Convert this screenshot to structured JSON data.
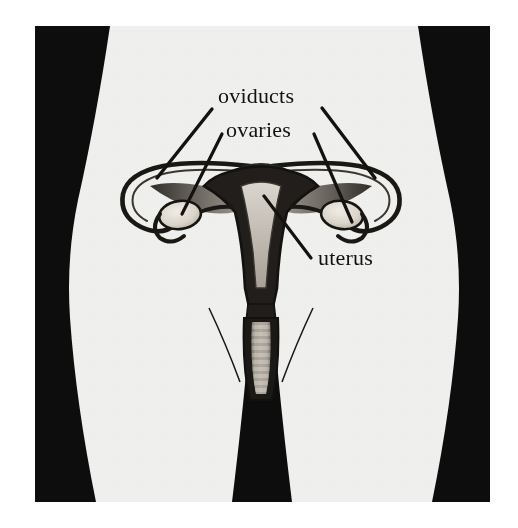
{
  "figure": {
    "caption": "",
    "frame": {
      "x": 35,
      "y": 26,
      "width": 455,
      "height": 476
    },
    "canvas": {
      "width": 518,
      "height": 528
    }
  },
  "colors": {
    "page_background": "#ffffff",
    "body_fill": "#f1f1ef",
    "silhouette_black": "#0d0d0d",
    "ink": "#14120f",
    "organ_dark": "#2a2724",
    "organ_mid": "#7b766f",
    "organ_light": "#cfcac2",
    "ovary_fill": "#e4dfd6",
    "cavity_fill": "#b9b3aa",
    "vagina_rugae": "#a39d94"
  },
  "labels": [
    {
      "id": "oviducts",
      "text": "oviducts",
      "x": 218,
      "y": 103,
      "anchor": "start",
      "font_size": 22
    },
    {
      "id": "ovaries",
      "text": "ovaries",
      "x": 226,
      "y": 137,
      "anchor": "start",
      "font_size": 22
    },
    {
      "id": "uterus",
      "text": "uterus",
      "x": 318,
      "y": 265,
      "anchor": "start",
      "font_size": 22
    }
  ],
  "leader_lines": [
    {
      "id": "leader-oviduct-left",
      "for": "oviducts",
      "x1": 212,
      "y1": 109,
      "x2": 157,
      "y2": 178
    },
    {
      "id": "leader-oviduct-right",
      "for": "oviducts",
      "x1": 322,
      "y1": 108,
      "x2": 375,
      "y2": 178
    },
    {
      "id": "leader-ovary-left",
      "for": "ovaries",
      "x1": 222,
      "y1": 134,
      "x2": 182,
      "y2": 214
    },
    {
      "id": "leader-ovary-right",
      "for": "ovaries",
      "x1": 314,
      "y1": 134,
      "x2": 352,
      "y2": 222
    },
    {
      "id": "leader-uterus",
      "for": "uterus",
      "x1": 264,
      "y1": 196,
      "x2": 311,
      "y2": 258
    }
  ],
  "anatomy_parts": [
    {
      "id": "uterus-body",
      "name": "uterus",
      "description": "pear shaped muscular organ at center"
    },
    {
      "id": "uterine-cavity",
      "name": "uterine cavity",
      "description": "light triangular inner space"
    },
    {
      "id": "oviduct-left",
      "name": "left oviduct",
      "description": "curved tube looping to left ovary"
    },
    {
      "id": "oviduct-right",
      "name": "right oviduct",
      "description": "curved tube looping to right ovary"
    },
    {
      "id": "ovary-left",
      "name": "left ovary",
      "description": "pale oval body"
    },
    {
      "id": "ovary-right",
      "name": "right ovary",
      "description": "pale oval body"
    },
    {
      "id": "cervix",
      "name": "cervix",
      "description": "narrow neck below uterus"
    },
    {
      "id": "vagina",
      "name": "vagina",
      "description": "ridged canal below cervix"
    },
    {
      "id": "labia-left",
      "name": "left labium",
      "description": "thin curved outline"
    },
    {
      "id": "labia-right",
      "name": "right labium",
      "description": "thin curved outline"
    }
  ],
  "silhouette": {
    "description": "female lower torso and thighs shown light against black background wedges",
    "regions": [
      "left-background-wedge",
      "right-background-wedge",
      "center-leg-gap-wedge"
    ]
  }
}
